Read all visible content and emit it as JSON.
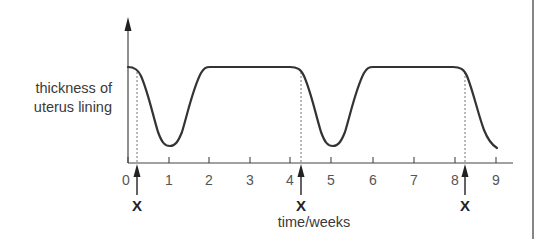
{
  "chart_data": {
    "type": "line",
    "title": "",
    "xlabel": "time/weeks",
    "ylabel_lines": [
      "thickness of",
      "uterus lining"
    ],
    "x_ticks": [
      "0",
      "1",
      "2",
      "3",
      "4",
      "5",
      "6",
      "7",
      "8",
      "9"
    ],
    "xlim": [
      0,
      9.4
    ],
    "y_ticks": [],
    "grid": false,
    "series": [
      {
        "name": "thickness of uterus lining",
        "x": [
          0,
          0.25,
          0.5,
          0.75,
          1.0,
          1.25,
          1.5,
          1.75,
          2.0,
          3.0,
          4.0,
          4.25,
          4.5,
          4.75,
          5.0,
          5.25,
          5.5,
          5.75,
          6.0,
          7.0,
          8.0,
          8.25,
          8.5,
          8.75,
          9.0
        ],
        "values": [
          1.0,
          0.93,
          0.55,
          0.15,
          0.0,
          0.1,
          0.5,
          0.88,
          1.0,
          1.0,
          1.0,
          0.93,
          0.55,
          0.15,
          0.0,
          0.1,
          0.5,
          0.88,
          1.0,
          1.0,
          1.0,
          0.93,
          0.55,
          0.2,
          0.0
        ]
      }
    ],
    "annotations": [
      {
        "label": "X",
        "x": 0.2,
        "type": "arrow-up-with-dashed-line"
      },
      {
        "label": "X",
        "x": 4.2,
        "type": "arrow-up-with-dashed-line"
      },
      {
        "label": "X",
        "x": 8.2,
        "type": "arrow-up-with-dashed-line"
      }
    ]
  },
  "labels": {
    "y1": "thickness of",
    "y2": "uterus lining",
    "x": "time/weeks",
    "ticks": [
      "0",
      "1",
      "2",
      "3",
      "4",
      "5",
      "6",
      "7",
      "8",
      "9"
    ],
    "marker": "X"
  }
}
